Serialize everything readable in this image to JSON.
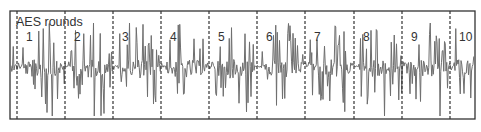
{
  "chart_data": {
    "type": "line",
    "title": "",
    "annotation": "AES rounds",
    "xlabel": "",
    "ylabel": "",
    "grid": false,
    "legend": null,
    "rounds": [
      "1",
      "2",
      "3",
      "4",
      "5",
      "6",
      "7",
      "8",
      "9",
      "10"
    ],
    "round_boundaries_px": [
      17,
      65,
      113,
      161,
      209,
      257,
      305,
      354,
      402,
      450
    ],
    "frame_px": {
      "left": 10,
      "top": 11,
      "right": 475,
      "bottom": 119
    },
    "baseline_px": 66,
    "series": [
      {
        "name": "power trace",
        "color": "#6e6e6e",
        "description": "noisy power consumption trace; quiet baseline at each round start followed by bursts of spikes up to ~y=25 and down to ~y=115"
      }
    ]
  },
  "labels": {
    "annotation": "AES rounds",
    "round_numbers": [
      "1",
      "2",
      "3",
      "4",
      "5",
      "6",
      "7",
      "8",
      "9",
      "10"
    ]
  },
  "colors": {
    "frame": "#333333",
    "trace": "#6e6e6e",
    "dashed": "#333333",
    "background": "#ffffff"
  }
}
